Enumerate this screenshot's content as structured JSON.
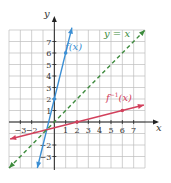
{
  "chart_data": {
    "type": "line",
    "title": "",
    "xlabel": "x",
    "ylabel": "y",
    "xlim": [
      -4,
      8
    ],
    "ylim": [
      -4,
      8
    ],
    "grid": true,
    "x_ticks": [
      -3,
      -2,
      1,
      2,
      3,
      4,
      5,
      6,
      7
    ],
    "y_ticks": [
      7,
      6,
      5,
      4,
      3,
      2,
      1,
      -2,
      -3
    ],
    "series": [
      {
        "name": "f(x)",
        "label": "f(x)",
        "equation": "y = 4x + 2",
        "color": "#3b8fd4",
        "dashed": false,
        "x": [
          -1.5,
          1.55
        ],
        "y": [
          -4,
          8.2
        ],
        "points": [
          [
            0,
            2
          ],
          [
            1,
            6
          ]
        ]
      },
      {
        "name": "f^-1(x)",
        "label": "f",
        "label_sup": "−1",
        "label_tail": "(x)",
        "equation": "y = (x - 2)/4",
        "color": "#d2405c",
        "dashed": false,
        "x": [
          -3.9,
          7.9
        ],
        "y": [
          -1.475,
          1.475
        ],
        "points": [
          [
            2,
            0
          ],
          [
            6,
            1
          ]
        ]
      },
      {
        "name": "y = x",
        "label": "y = x",
        "equation": "y = x",
        "color": "#3d8b3d",
        "dashed": true,
        "x": [
          -4,
          8
        ],
        "y": [
          -4,
          8
        ],
        "points": []
      }
    ]
  }
}
